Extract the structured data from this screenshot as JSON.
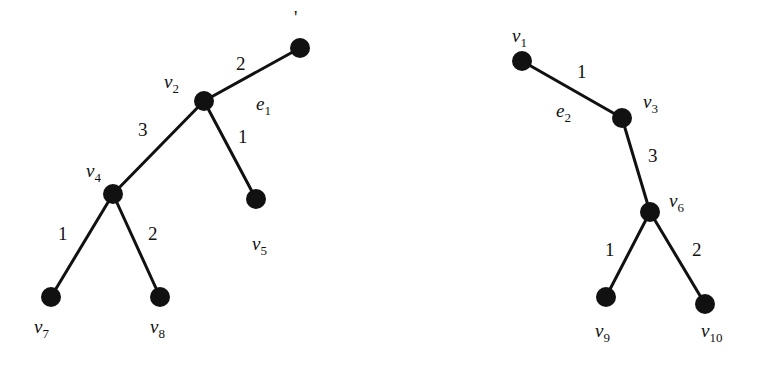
{
  "diagram": {
    "type": "weighted-trees",
    "trees": [
      {
        "name": "left-tree",
        "nodes": [
          {
            "id": "top",
            "label": "",
            "x": 300,
            "y": 48
          },
          {
            "id": "v2",
            "label": "v",
            "sub": "2",
            "x": 204,
            "y": 101
          },
          {
            "id": "v4",
            "label": "v",
            "sub": "4",
            "x": 113,
            "y": 194
          },
          {
            "id": "v5",
            "label": "v",
            "sub": "5",
            "x": 256,
            "y": 199
          },
          {
            "id": "v7",
            "label": "v",
            "sub": "7",
            "x": 51,
            "y": 297
          },
          {
            "id": "v8",
            "label": "v",
            "sub": "8",
            "x": 160,
            "y": 297
          }
        ],
        "edges": [
          {
            "from": "top",
            "to": "v2",
            "weight": "2"
          },
          {
            "from": "v2",
            "to": "v4",
            "weight": "3"
          },
          {
            "from": "v2",
            "to": "v5",
            "weight": "1"
          },
          {
            "from": "v4",
            "to": "v7",
            "weight": "1"
          },
          {
            "from": "v4",
            "to": "v8",
            "weight": "2"
          }
        ],
        "edge_label": {
          "text": "e",
          "sub": "1"
        }
      },
      {
        "name": "right-tree",
        "nodes": [
          {
            "id": "v1",
            "label": "v",
            "sub": "1",
            "x": 522,
            "y": 61
          },
          {
            "id": "v3",
            "label": "v",
            "sub": "3",
            "x": 622,
            "y": 118
          },
          {
            "id": "v6",
            "label": "v",
            "sub": "6",
            "x": 650,
            "y": 212
          },
          {
            "id": "v9",
            "label": "v",
            "sub": "9",
            "x": 606,
            "y": 297
          },
          {
            "id": "v10",
            "label": "v",
            "sub": "10",
            "x": 705,
            "y": 304
          }
        ],
        "edges": [
          {
            "from": "v1",
            "to": "v3",
            "weight": "1"
          },
          {
            "from": "v3",
            "to": "v6",
            "weight": "3"
          },
          {
            "from": "v6",
            "to": "v9",
            "weight": "1"
          },
          {
            "from": "v6",
            "to": "v10",
            "weight": "2"
          }
        ],
        "edge_label": {
          "text": "e",
          "sub": "2"
        }
      }
    ],
    "labels": {
      "w_top_v2": "2",
      "w_v2_v4": "3",
      "w_v2_v5": "1",
      "w_v4_v7": "1",
      "w_v4_v8": "2",
      "w_v1_v3": "1",
      "w_v3_v6": "3",
      "w_v6_v9": "1",
      "w_v6_v10": "2",
      "v": "v",
      "e": "e",
      "s1": "1",
      "s2": "2",
      "s3": "3",
      "s4": "4",
      "s5": "5",
      "s6": "6",
      "s7": "7",
      "s8": "8",
      "s9": "9",
      "s10": "10",
      "top_partial": "'"
    }
  }
}
